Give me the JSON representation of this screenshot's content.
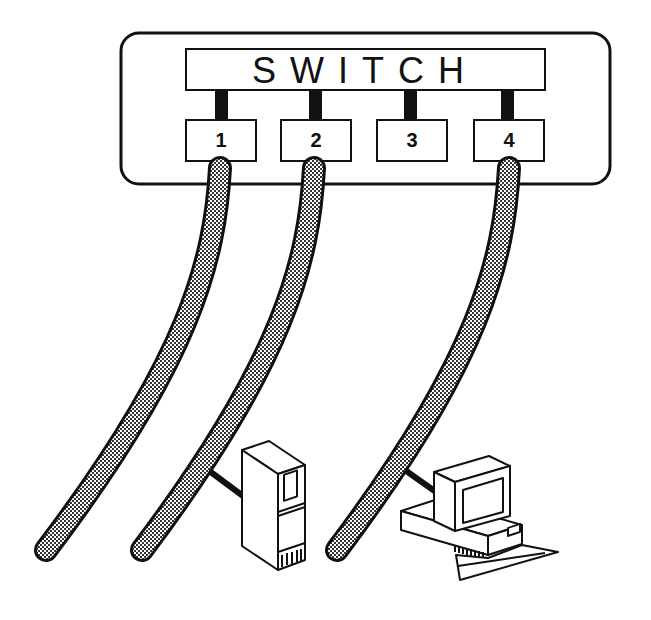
{
  "diagram": {
    "switch": {
      "label": "SWITCH",
      "ports": [
        {
          "label": "1",
          "connected": true
        },
        {
          "label": "2",
          "connected": true
        },
        {
          "label": "3",
          "connected": false
        },
        {
          "label": "4",
          "connected": true
        }
      ]
    },
    "cables": [
      {
        "port": "1",
        "attached_device": "none"
      },
      {
        "port": "2",
        "attached_device": "server-tower"
      },
      {
        "port": "4",
        "attached_device": "desktop-computer"
      }
    ],
    "devices": [
      {
        "type": "server-tower-icon"
      },
      {
        "type": "desktop-computer-icon"
      }
    ],
    "colors": {
      "line": "#111111",
      "background": "#ffffff",
      "cable_fill": "#9a9a9a"
    }
  }
}
